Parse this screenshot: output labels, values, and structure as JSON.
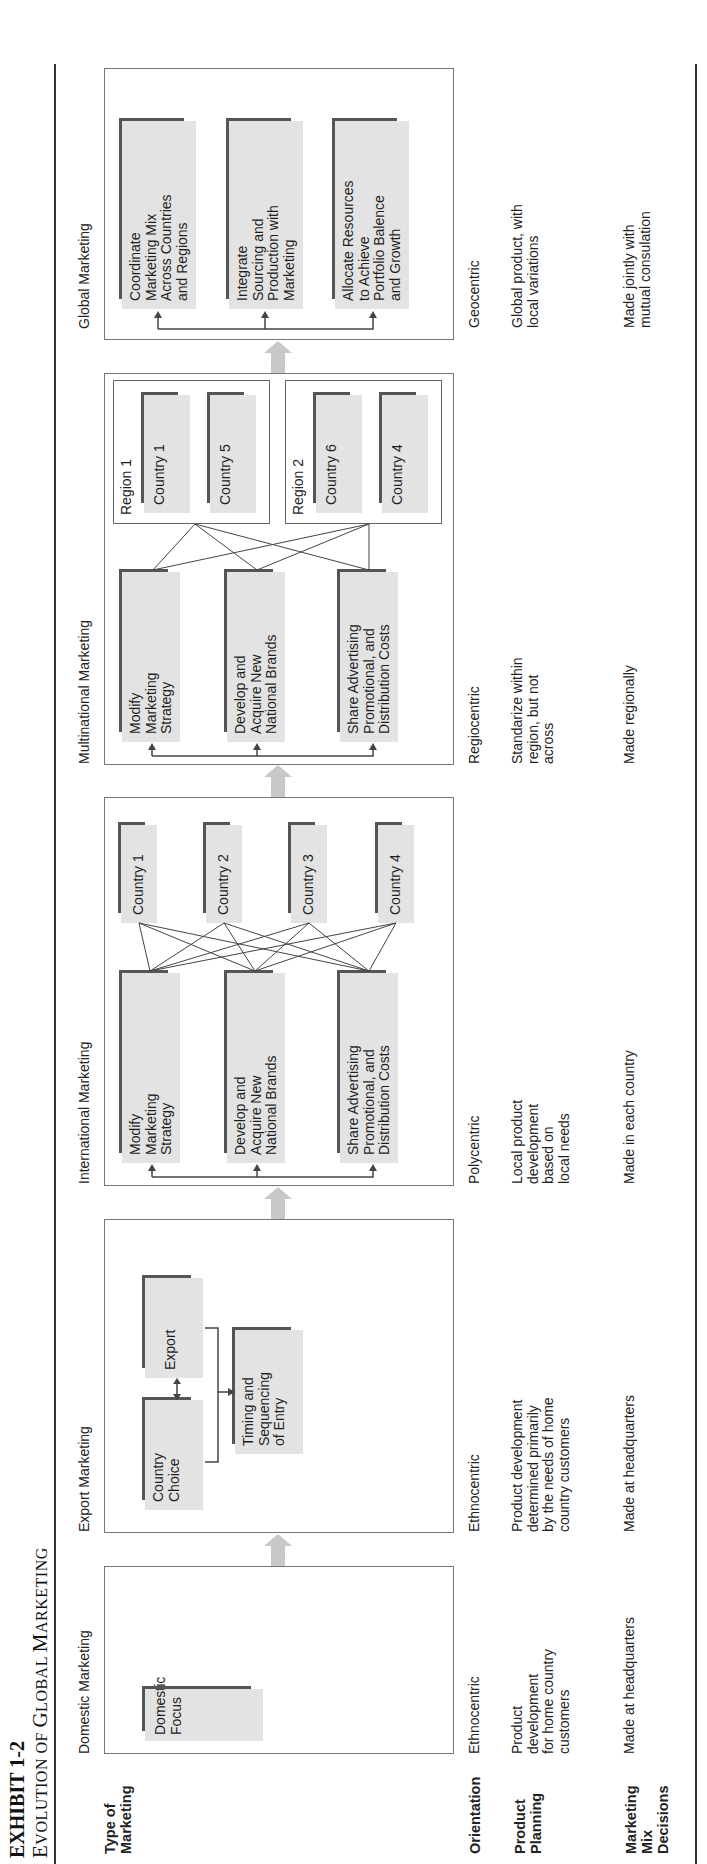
{
  "exhibit": {
    "number": "EXHIBIT 1-2",
    "title_prefix": "E",
    "title_rest": "VOLUTION OF ",
    "title_g": "G",
    "title_lobal": "LOBAL ",
    "title_m": "M",
    "title_arketing": "ARKETING",
    "full_title": "EVOLUTION OF GLOBAL MARKETING"
  },
  "row_labels": {
    "type": "Type of Marketing",
    "type_line1": "Type of",
    "type_line2": "Marketing",
    "orientation": "Orientation",
    "planning_line1": "Product",
    "planning_line2": "Planning",
    "mix_line1": "Marketing",
    "mix_line2": "Mix",
    "mix_line3": "Decisions"
  },
  "stages": [
    {
      "name": "Domestic Marketing",
      "boxes": [
        "Domestic Focus"
      ],
      "box_lines": [
        [
          "Domestic",
          "Focus"
        ]
      ],
      "orientation": "Ethnocentric",
      "product_planning": [
        "Product",
        "development",
        "for home country",
        "customers"
      ],
      "marketing_mix": "Made at headquarters"
    },
    {
      "name": "Export Marketing",
      "boxes": [
        "Country Choice",
        "Export",
        "Timing and Sequencing of Entry"
      ],
      "box_lines": [
        [
          "Country",
          "Choice"
        ],
        [
          "Export"
        ],
        [
          "Timing and",
          "Sequencing",
          "of Entry"
        ]
      ],
      "orientation": "Ethnocentric",
      "product_planning": [
        "Product development",
        "determined primarily",
        "by the needs of home",
        "country customers"
      ],
      "marketing_mix": "Made at headquarters"
    },
    {
      "name": "International Marketing",
      "boxes": [
        "Modify Marketing Strategy",
        "Develop and Acquire New National Brands",
        "Share Advertising Promotional, and Distribution Costs"
      ],
      "box_lines": [
        [
          "Modify",
          "Marketing",
          "Strategy"
        ],
        [
          "Develop and",
          "Acquire New",
          "National Brands"
        ],
        [
          "Share Advertising",
          "Promotional, and",
          "Distribution Costs"
        ]
      ],
      "countries": [
        "Country 1",
        "Country 2",
        "Country 3",
        "Country 4"
      ],
      "orientation": "Polycentric",
      "product_planning": [
        "Local product",
        "development",
        "based on",
        "local needs"
      ],
      "marketing_mix": "Made in each country"
    },
    {
      "name": "Multinational Marketing",
      "boxes": [
        "Modify Marketing Strategy",
        "Develop and Acquire New National Brands",
        "Share Advertising Promotional, and Distribution Costs"
      ],
      "box_lines": [
        [
          "Modify",
          "Marketing",
          "Strategy"
        ],
        [
          "Develop and",
          "Acquire New",
          "National Brands"
        ],
        [
          "Share Advertising",
          "Promotional, and",
          "Distribution Costs"
        ]
      ],
      "regions": [
        {
          "label": "Region 1",
          "countries": [
            "Country 1",
            "Country 5"
          ]
        },
        {
          "label": "Region 2",
          "countries": [
            "Country 6",
            "Country 4"
          ]
        }
      ],
      "orientation": "Regiocentric",
      "product_planning": [
        "Standarize within",
        "region, but not",
        "across"
      ],
      "marketing_mix": "Made regionally"
    },
    {
      "name": "Global Marketing",
      "boxes": [
        "Coordinate Marketing Mix Across Countries and Regions",
        "Integrate Sourcing and Production with Marketing",
        "Allocate Resources to Achieve Portfolio Balence and Growth"
      ],
      "box_lines": [
        [
          "Coordinate",
          "Marketing Mix",
          "Across Countries",
          "and Regions"
        ],
        [
          "Integrate",
          "Sourcing and",
          "Production with",
          "Marketing"
        ],
        [
          "Allocate Resources",
          "to Achieve",
          "Portfolio Balence",
          "and Growth"
        ]
      ],
      "orientation": "Geocentric",
      "product_planning": [
        "Global product, with",
        "local variations"
      ],
      "marketing_mix": [
        "Made jointly with",
        "mutual consulation"
      ]
    }
  ],
  "colors": {
    "box_fill": "#e3e3e3",
    "box_shadow": "#555555",
    "panel_border": "#777777",
    "stage_arrow": "#c8c8c8",
    "connector": "#444444"
  }
}
